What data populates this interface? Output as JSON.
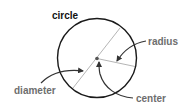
{
  "diagram": {
    "title": "circle",
    "labels": {
      "circle": "circle",
      "radius": "radius",
      "diameter": "diameter",
      "center": "center"
    },
    "colors": {
      "background": "#ffffff",
      "circle_stroke": "#1a1a1a",
      "guide_line": "#b5b5b5",
      "center_dot": "#555555",
      "arrow": "#333333",
      "title_text": "#111111",
      "label_text": "#6e6e6e"
    }
  }
}
